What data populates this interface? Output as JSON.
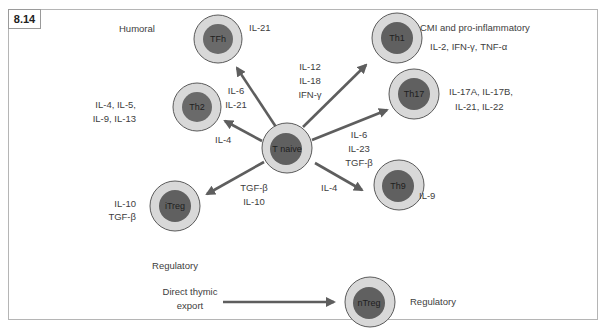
{
  "figure": {
    "label": "8.14"
  },
  "colors": {
    "outer_cell_fill": "#d8d8d8",
    "outer_cell_stroke": "#5a5a5a",
    "nucleus_fill": "#6a6a6a",
    "arrow": "#5e5e5e",
    "frame": "#b5b5b5"
  },
  "center_cell": {
    "name": "T naive"
  },
  "cells": {
    "tfh": {
      "name": "TFh",
      "function": "Humoral",
      "secreted": [
        "IL-21"
      ],
      "inducers": [
        "IL-6",
        "IL-21"
      ]
    },
    "th1": {
      "name": "Th1",
      "function": "CMI and pro-inflammatory",
      "secreted": [
        "IL-2, IFN-γ, TNF-α"
      ],
      "inducers": [
        "IL-12",
        "IL-18",
        "IFN-γ"
      ]
    },
    "th2": {
      "name": "Th2",
      "secreted": [
        "IL-4, IL-5,",
        "IL-9, IL-13"
      ],
      "inducers": [
        "IL-4"
      ]
    },
    "th17": {
      "name": "Th17",
      "secreted": [
        "IL-17A, IL-17B,",
        "IL-21, IL-22"
      ],
      "inducers": [
        "IL-6",
        "IL-23",
        "TGF-β"
      ]
    },
    "itreg": {
      "name": "iTreg",
      "function": "Regulatory",
      "secreted": [
        "IL-10",
        "TGF-β"
      ],
      "inducers": [
        "TGF-β",
        "IL-10"
      ]
    },
    "th9": {
      "name": "Th9",
      "secreted": [
        "IL-9"
      ],
      "inducers": [
        "IL-4"
      ]
    },
    "ntreg": {
      "name": "nTreg",
      "function": "Regulatory",
      "source": [
        "Direct thymic",
        "export"
      ]
    }
  }
}
